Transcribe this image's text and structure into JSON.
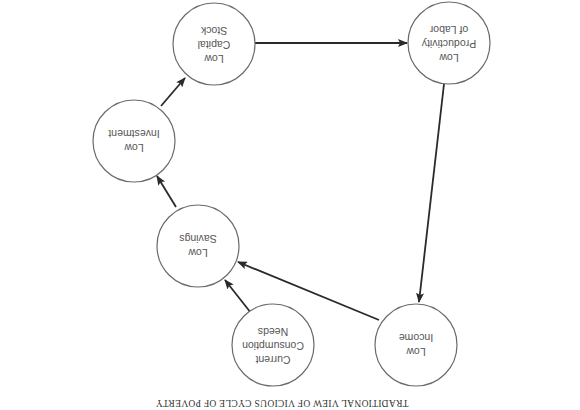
{
  "orientation": "rotated-180",
  "caption": "TRADITIONAL VIEW OF VICIOUS CYCLE OF POVERTY",
  "colors": {
    "background": "#ffffff",
    "circle_stroke": "#6a6a6a",
    "arrow": "#2a2a2a",
    "text": "#555555"
  },
  "nodes": [
    {
      "id": "low-productivity",
      "lines": [
        "Low",
        "Productivity",
        "of Labor"
      ]
    },
    {
      "id": "low-capital-stock",
      "lines": [
        "Low",
        "Capital",
        "Stock"
      ]
    },
    {
      "id": "low-investment",
      "lines": [
        "Low",
        "Investment"
      ]
    },
    {
      "id": "low-savings",
      "lines": [
        "Low",
        "Savings"
      ]
    },
    {
      "id": "current-consumption-needs",
      "lines": [
        "Current",
        "Consumption",
        "Needs"
      ]
    },
    {
      "id": "low-income",
      "lines": [
        "Low",
        "Income"
      ]
    }
  ],
  "edges": [
    {
      "from": "low-capital-stock",
      "to": "low-productivity"
    },
    {
      "from": "low-productivity",
      "to": "low-income"
    },
    {
      "from": "low-income",
      "to": "low-savings"
    },
    {
      "from": "current-consumption-needs",
      "to": "low-savings"
    },
    {
      "from": "low-savings",
      "to": "low-investment"
    },
    {
      "from": "low-investment",
      "to": "low-capital-stock"
    }
  ]
}
